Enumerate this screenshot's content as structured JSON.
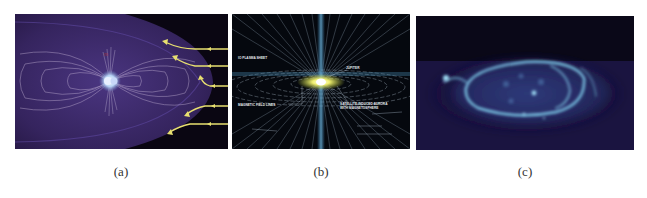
{
  "figure": {
    "panels": [
      {
        "id": "a",
        "caption": "(a)",
        "description": "Planetary magnetosphere with dipole field lines and solar wind arrows",
        "colors": {
          "background": "#0a0612",
          "magnetosphere": "#3d2a6b",
          "field_lines": "#c8b8d8",
          "arrows": "#e8e070",
          "planet": "#b8d0f0"
        }
      },
      {
        "id": "b",
        "caption": "(b)",
        "description": "Jupiter magnetosphere diagram with radial field lines and Io plasma torus",
        "labels": [
          "IO PLASMA SHEET",
          "JUPITER",
          "MAGNETIC FIELD LINES",
          "SATELLITE-INDUCED AURORA",
          "WITH MAGNETOSPHERE"
        ],
        "colors": {
          "background": "#05080e",
          "field_lines": "#a8c8e0",
          "axis": "#5aa0c8",
          "torus": "#e8e860"
        }
      },
      {
        "id": "c",
        "caption": "(c)",
        "description": "Ultraviolet image of an auroral oval",
        "colors": {
          "background": "#0a0818",
          "glow": "#1c1a48",
          "aurora": "#7ec8e8"
        }
      }
    ]
  }
}
